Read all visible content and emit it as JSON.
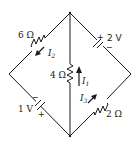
{
  "diagram": {
    "type": "circuit",
    "nodes": [
      "top",
      "left",
      "right",
      "bottom"
    ],
    "components": {
      "r_top_left": {
        "label": "6 Ω",
        "kind": "resistor",
        "branch": "top-left"
      },
      "v_top_right": {
        "label": "2 V",
        "kind": "battery",
        "branch": "top-right",
        "plus": "+",
        "minus": "−"
      },
      "r_middle": {
        "label": "4 Ω",
        "kind": "resistor",
        "branch": "top-bottom"
      },
      "v_bottom_left": {
        "label": "1 V",
        "kind": "battery",
        "branch": "left-bottom",
        "plus": "+",
        "minus": "−"
      },
      "r_bottom_right": {
        "label": "2 Ω",
        "kind": "resistor",
        "branch": "bottom-right"
      }
    },
    "currents": {
      "i1": {
        "symbol": "I",
        "subscript": "1",
        "direction": "up",
        "branch": "top-bottom"
      },
      "i2": {
        "symbol": "I",
        "subscript": "2",
        "direction": "down-left",
        "branch": "top-left"
      },
      "i3": {
        "symbol": "I",
        "subscript": "3",
        "direction": "up-right",
        "branch": "bottom-right"
      }
    }
  }
}
